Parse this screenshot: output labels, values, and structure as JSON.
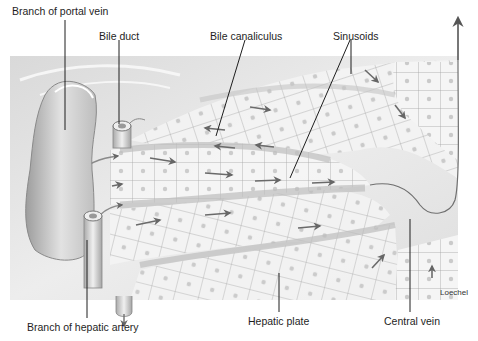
{
  "figure": {
    "labels": {
      "portal_vein": "Branch of portal vein",
      "bile_duct": "Bile duct",
      "bile_canaliculus": "Bile canaliculus",
      "sinusoids": "Sinusoids",
      "hepatic_artery": "Branch of hepatic artery",
      "hepatic_plate": "Hepatic plate",
      "central_vein": "Central vein"
    },
    "credit": "Loechel",
    "colors": {
      "background": "#ffffff",
      "panel": "#e9e9e9",
      "cell_fill": "#f4f4f4",
      "cell_line": "#9a9a9a",
      "nucleus": "#c8c8c8",
      "arrow": "#6a6a6a",
      "leader_line": "#222222"
    }
  }
}
